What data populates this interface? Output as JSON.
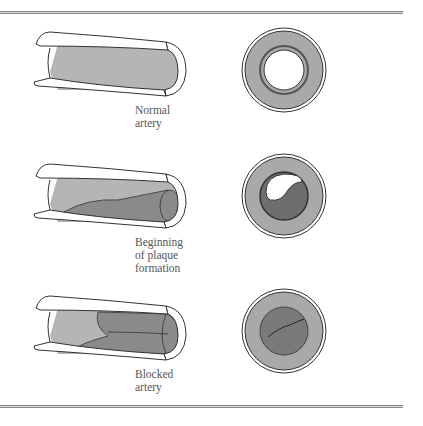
{
  "figure": {
    "stages": [
      {
        "id": "normal",
        "label_lines": [
          "Normal",
          "artery"
        ]
      },
      {
        "id": "beginning",
        "label_lines": [
          "Beginning",
          "of plaque",
          "formation"
        ]
      },
      {
        "id": "blocked",
        "label_lines": [
          "Blocked",
          "artery"
        ]
      }
    ],
    "colors": {
      "wall": "#ffffff",
      "lumen_inner": "#b5b5b5",
      "plaque": "#8a8a8a",
      "cross_section_wall": "#a9a9a9",
      "outline": "#333333",
      "rule": "#888888"
    }
  }
}
